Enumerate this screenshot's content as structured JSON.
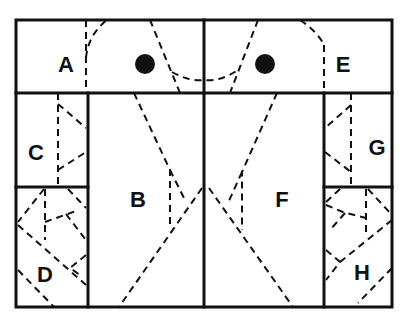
{
  "diagram": {
    "colors": {
      "line": "#111111",
      "background": "#ffffff"
    },
    "regions": [
      {
        "id": "A",
        "label": "A",
        "x": 66,
        "y": 72
      },
      {
        "id": "B",
        "label": "B",
        "x": 138,
        "y": 207
      },
      {
        "id": "C",
        "label": "C",
        "x": 36,
        "y": 160
      },
      {
        "id": "D",
        "label": "D",
        "x": 45,
        "y": 282
      },
      {
        "id": "E",
        "label": "E",
        "x": 343,
        "y": 72
      },
      {
        "id": "F",
        "label": "F",
        "x": 282,
        "y": 207
      },
      {
        "id": "G",
        "label": "G",
        "x": 377,
        "y": 155
      },
      {
        "id": "H",
        "label": "H",
        "x": 362,
        "y": 280
      }
    ],
    "dots": [
      {
        "name": "left-dot",
        "cx": 145,
        "cy": 64,
        "r": 10
      },
      {
        "name": "right-dot",
        "cx": 265,
        "cy": 64,
        "r": 10
      }
    ]
  }
}
